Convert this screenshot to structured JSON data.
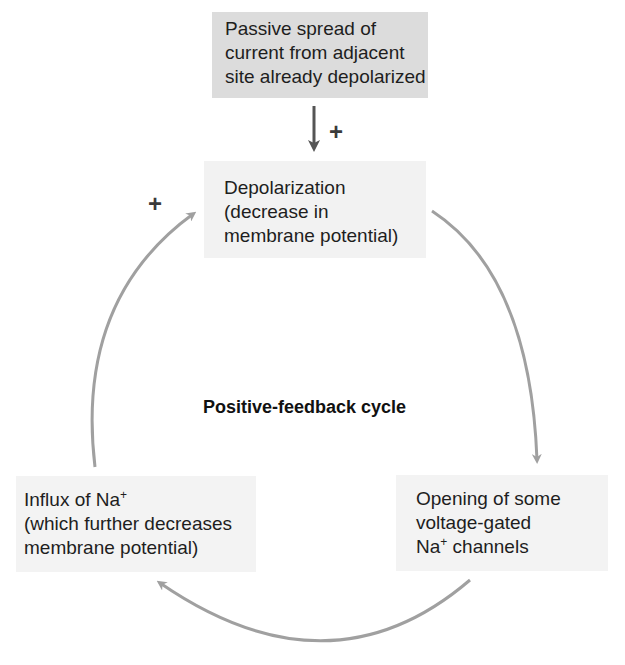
{
  "diagram": {
    "title": "Positive-feedback cycle",
    "boxes": {
      "passive": {
        "lines": [
          "Passive spread of",
          "current from adjacent",
          "site already depolarized"
        ]
      },
      "depolarization": {
        "lines": [
          "Depolarization",
          "(decrease in",
          "membrane potential)"
        ]
      },
      "opening": {
        "line1": "Opening of some",
        "line2": "voltage-gated",
        "line3_pre": "Na",
        "line3_sup": "+",
        "line3_post": " channels"
      },
      "influx": {
        "line1_pre": "Influx of Na",
        "line1_sup": "+",
        "line2": "(which further decreases",
        "line3": "membrane potential)"
      }
    },
    "signs": {
      "passive_to_depolarization": "+",
      "influx_to_depolarization": "+"
    },
    "arrows": [
      {
        "from": "passive",
        "to": "depolarization",
        "color": "#555555",
        "sign": "+"
      },
      {
        "from": "depolarization",
        "to": "opening",
        "color": "#a0a0a0"
      },
      {
        "from": "opening",
        "to": "influx",
        "color": "#a0a0a0"
      },
      {
        "from": "influx",
        "to": "depolarization",
        "color": "#a0a0a0",
        "sign": "+"
      }
    ],
    "colors": {
      "passive_box": "#dcdcdc",
      "cycle_box": "#f2f2f2",
      "cycle_arrow": "#a0a0a0",
      "input_arrow": "#555555"
    }
  }
}
